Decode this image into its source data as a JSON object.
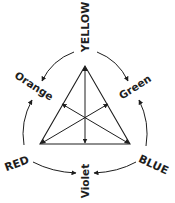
{
  "diagram": {
    "type": "color-triangle",
    "primary_colors": [
      {
        "name": "YELLOW",
        "position": "top"
      },
      {
        "name": "RED",
        "position": "bottom-left"
      },
      {
        "name": "BLUE",
        "position": "bottom-right"
      }
    ],
    "secondary_colors": [
      {
        "name": "Orange",
        "mixes": [
          "YELLOW",
          "RED"
        ],
        "position": "upper-left"
      },
      {
        "name": "Green",
        "mixes": [
          "YELLOW",
          "BLUE"
        ],
        "position": "upper-right"
      },
      {
        "name": "Violet",
        "mixes": [
          "RED",
          "BLUE"
        ],
        "position": "bottom"
      }
    ],
    "line_color": "#1e1e1e",
    "background": "#ffffff"
  },
  "labels": {
    "yellow": "YELLOW",
    "red": "RED",
    "blue": "BLUE",
    "orange": "Orange",
    "green": "Green",
    "violet": "Violet"
  }
}
